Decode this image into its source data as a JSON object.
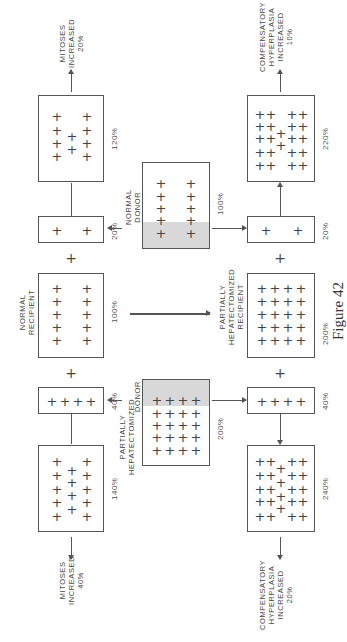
{
  "figure_caption": "Figure 42",
  "top_row": {
    "normal_recipient": {
      "label": "NORMAL\nRECIPIENT",
      "pct": "100%"
    },
    "normal_donor_fraction": {
      "pct": "20%"
    },
    "result": {
      "pct": "120%"
    },
    "outcome": "MITOSES\nINCREASED\n20%"
  },
  "top_right": {
    "ph_recipient": {
      "label": "PARTIALLY\nHEPATECTOMIZED\nRECIPIENT",
      "pct": "200%"
    },
    "normal_donor_fraction": {
      "pct": "20%"
    },
    "result": {
      "pct": "220%"
    },
    "outcome": "COMPENSATORY\nHYPERPLASIA\nINCREASED\n10%"
  },
  "normal_donor": {
    "label": "NORMAL\nDONOR",
    "pct": "100%"
  },
  "ph_donor": {
    "label_main": "PARTIALLY\nHEPATECTOMIZED",
    "label_donor": "DONOR",
    "pct": "200%"
  },
  "bottom_left": {
    "ph_donor_fraction": {
      "pct": "40%"
    },
    "result": {
      "pct": "140%"
    },
    "outcome": "MITOSES\nINCREASED\n40%"
  },
  "bottom_right": {
    "ph_donor_fraction": {
      "pct": "40%"
    },
    "result": {
      "pct": "240%"
    },
    "outcome": "COMPENSATORY\nHYPERPLASIA\nINCREASED\n20%"
  },
  "symbols": {
    "plus": "+"
  }
}
